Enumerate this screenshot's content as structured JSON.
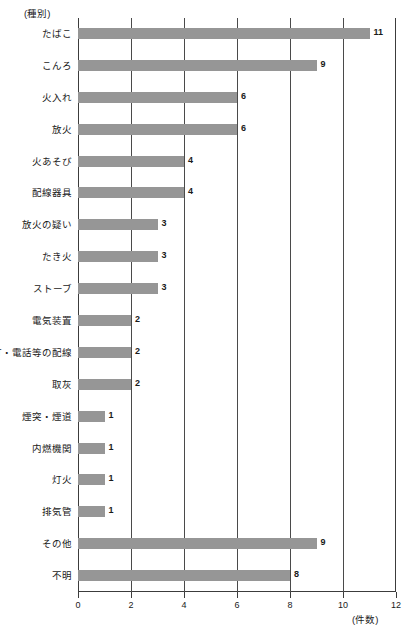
{
  "chart_data": {
    "type": "bar",
    "orientation": "horizontal",
    "title": "",
    "xlabel": "(件数)",
    "ylabel": "(種別)",
    "xlim": [
      0,
      12
    ],
    "xticks": [
      0,
      2,
      4,
      6,
      8,
      10,
      12
    ],
    "xtick_labels": [
      "0",
      "2",
      "4",
      "6",
      "8",
      "10",
      "12"
    ],
    "grid": true,
    "grid_axis": "x",
    "legend": "none",
    "bar_color": "#969696",
    "axis_color": "#3c3c3c",
    "categories": [
      "たばこ",
      "こんろ",
      "火入れ",
      "放火",
      "火あそび",
      "配線器具",
      "放火の疑い",
      "たき火",
      "ストーブ",
      "電気装置",
      "電灯・電話等の配線",
      "取灰",
      "煙突・煙道",
      "内燃機関",
      "灯火",
      "排気管",
      "その他",
      "不明"
    ],
    "values": [
      11,
      9,
      6,
      6,
      4,
      4,
      3,
      3,
      3,
      2,
      2,
      2,
      1,
      1,
      1,
      1,
      9,
      8
    ],
    "value_labels": [
      "11",
      "9",
      "6",
      "6",
      "4",
      "4",
      "3",
      "3",
      "3",
      "2",
      "2",
      "2",
      "1",
      "1",
      "1",
      "1",
      "9",
      "8"
    ]
  }
}
